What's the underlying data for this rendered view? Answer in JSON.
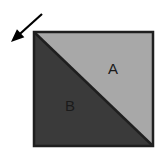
{
  "figure": {
    "background_color": "#ffffff",
    "square": {
      "name": "square-outline",
      "x": 34,
      "y": 32,
      "width": 119,
      "height": 114,
      "border_color": "#1f1f1f",
      "border_width": 2.5
    },
    "diagonal": {
      "name": "diagonal-divider",
      "from": "top-left",
      "to": "bottom-right",
      "color": "#1f1f1f",
      "width": 2.5
    },
    "regions": [
      {
        "id": "A",
        "label": "A",
        "position": "upper-right",
        "fill_color": "#a8a8a8",
        "label_x": 113,
        "label_y": 70
      },
      {
        "id": "B",
        "label": "B",
        "position": "lower-left",
        "fill_color": "#3a3a3a",
        "label_x": 70,
        "label_y": 107
      }
    ],
    "arrow": {
      "name": "incoming-arrow",
      "direction": "down-left",
      "color": "#000000",
      "tail_x": 42,
      "tail_y": 14,
      "tip_x": 11,
      "tip_y": 42,
      "shaft_width": 2.2
    }
  }
}
